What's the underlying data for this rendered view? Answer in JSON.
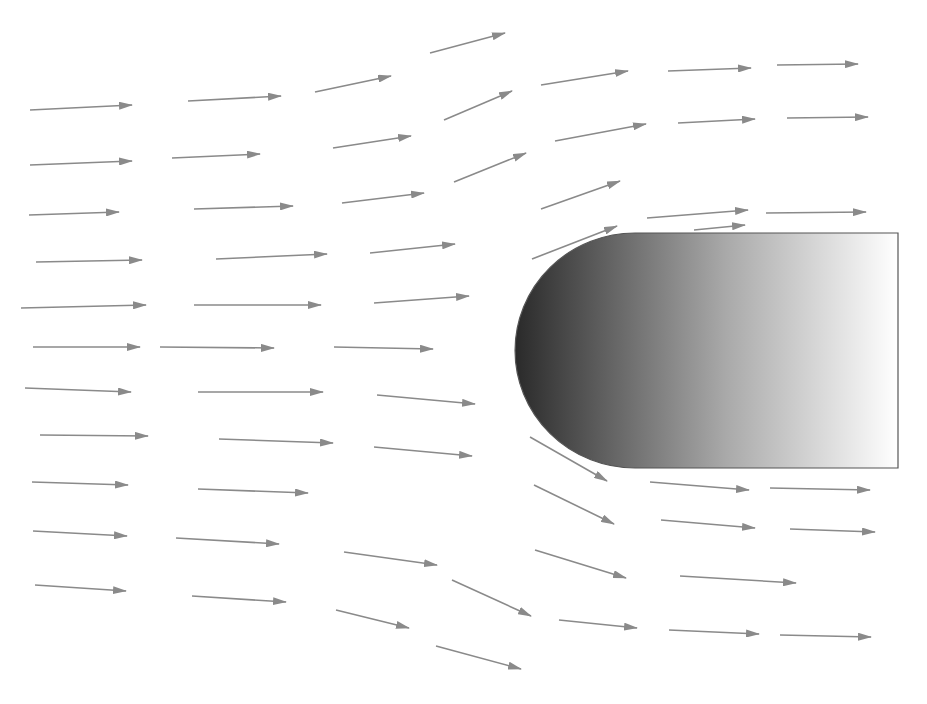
{
  "diagram": {
    "colors": {
      "arrow": "#8a8a8a",
      "body_dark": "#2a2a2a",
      "body_light": "#ffffff",
      "body_stroke": "#555555",
      "background": "#ffffff"
    },
    "body": {
      "left": 515,
      "top": 233,
      "right": 898,
      "bottom": 468,
      "nose_rx": 120
    },
    "arrows": [
      [
        430,
        53,
        505,
        33
      ],
      [
        30,
        110,
        132,
        105
      ],
      [
        188,
        101,
        281,
        96
      ],
      [
        315,
        92,
        391,
        76
      ],
      [
        444,
        120,
        512,
        91
      ],
      [
        541,
        85,
        628,
        71
      ],
      [
        668,
        71,
        751,
        68
      ],
      [
        777,
        65,
        858,
        64
      ],
      [
        30,
        165,
        132,
        161
      ],
      [
        172,
        158,
        260,
        154
      ],
      [
        333,
        148,
        411,
        136
      ],
      [
        454,
        182,
        526,
        153
      ],
      [
        555,
        141,
        646,
        124
      ],
      [
        678,
        123,
        755,
        119
      ],
      [
        787,
        118,
        868,
        117
      ],
      [
        29,
        215,
        119,
        212
      ],
      [
        194,
        209,
        293,
        206
      ],
      [
        342,
        203,
        424,
        193
      ],
      [
        541,
        209,
        620,
        181
      ],
      [
        647,
        218,
        748,
        210
      ],
      [
        766,
        213,
        866,
        212
      ],
      [
        36,
        262,
        142,
        260
      ],
      [
        216,
        259,
        327,
        254
      ],
      [
        370,
        253,
        455,
        244
      ],
      [
        532,
        259,
        617,
        226
      ],
      [
        694,
        230,
        745,
        225
      ],
      [
        21,
        308,
        146,
        305
      ],
      [
        194,
        305,
        321,
        305
      ],
      [
        374,
        303,
        469,
        296
      ],
      [
        33,
        347,
        140,
        347
      ],
      [
        160,
        347,
        274,
        348
      ],
      [
        334,
        347,
        433,
        349
      ],
      [
        25,
        388,
        131,
        392
      ],
      [
        198,
        392,
        323,
        392
      ],
      [
        377,
        395,
        475,
        404
      ],
      [
        40,
        435,
        148,
        436
      ],
      [
        219,
        439,
        333,
        443
      ],
      [
        374,
        447,
        472,
        456
      ],
      [
        32,
        482,
        128,
        485
      ],
      [
        198,
        489,
        308,
        493
      ],
      [
        530,
        437,
        607,
        481
      ],
      [
        650,
        482,
        749,
        490
      ],
      [
        770,
        488,
        870,
        490
      ],
      [
        33,
        531,
        127,
        536
      ],
      [
        176,
        538,
        279,
        544
      ],
      [
        344,
        552,
        437,
        565
      ],
      [
        534,
        485,
        614,
        524
      ],
      [
        661,
        520,
        755,
        528
      ],
      [
        790,
        529,
        875,
        532
      ],
      [
        35,
        585,
        126,
        591
      ],
      [
        192,
        596,
        286,
        602
      ],
      [
        336,
        610,
        409,
        628
      ],
      [
        452,
        580,
        531,
        616
      ],
      [
        535,
        550,
        626,
        578
      ],
      [
        680,
        576,
        796,
        583
      ],
      [
        436,
        646,
        521,
        669
      ],
      [
        559,
        620,
        637,
        628
      ],
      [
        669,
        630,
        759,
        634
      ],
      [
        780,
        635,
        871,
        637
      ]
    ]
  }
}
